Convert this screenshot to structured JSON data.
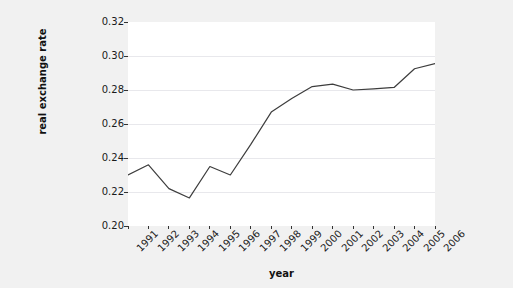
{
  "chart_data": {
    "type": "line",
    "title": "",
    "subtitle": "",
    "xlabel": "year",
    "ylabel": "real exchange rate",
    "categories": [
      "1991",
      "1992",
      "1993",
      "1994",
      "1995",
      "1996",
      "1997",
      "1998",
      "1999",
      "2000",
      "2001",
      "2002",
      "2003",
      "2004",
      "2005",
      "2006"
    ],
    "x": [
      1991,
      1992,
      1993,
      1994,
      1995,
      1996,
      1997,
      1998,
      1999,
      2000,
      2001,
      2002,
      2003,
      2004,
      2005,
      2006
    ],
    "values": [
      0.23,
      0.236,
      0.222,
      0.2165,
      0.235,
      0.23,
      0.248,
      0.267,
      0.275,
      0.282,
      0.2835,
      0.28,
      0.2807,
      0.2815,
      0.2925,
      0.2955
    ],
    "series": [
      {
        "name": "real exchange rate",
        "values": [
          0.23,
          0.236,
          0.222,
          0.2165,
          0.235,
          0.23,
          0.248,
          0.267,
          0.275,
          0.282,
          0.2835,
          0.28,
          0.2807,
          0.2815,
          0.2925,
          0.2955
        ]
      }
    ],
    "ylim": [
      0.2,
      0.32
    ],
    "xlim": [
      1991,
      2006
    ],
    "yticks": [
      0.2,
      0.22,
      0.24,
      0.26,
      0.28,
      0.3,
      0.32
    ],
    "ytick_labels": [
      "0.20",
      "0.22",
      "0.24",
      "0.26",
      "0.28",
      "0.30",
      "0.32"
    ],
    "xtick_labels": [
      "1991",
      "1992",
      "1993",
      "1994",
      "1995",
      "1996",
      "1997",
      "1998",
      "1999",
      "2000",
      "2001",
      "2002",
      "2003",
      "2004",
      "2005",
      "2006"
    ],
    "grid": true,
    "grid_axis": "y",
    "legend": false,
    "legend_position": "none",
    "line_color": "#3d3d3d",
    "line_width": 1.2,
    "marker": "none",
    "panel_background": "#ffffff",
    "figure_background": "#f1f1f1",
    "grid_color": "#e8e8ec",
    "axis_text_color": "#1a1a1a",
    "annotations": []
  },
  "axes": {
    "y_title": "real exchange rate",
    "x_title": "year"
  }
}
